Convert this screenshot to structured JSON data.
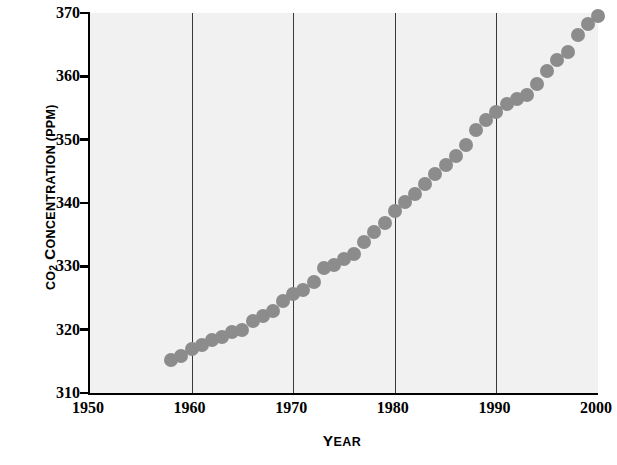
{
  "chart_data": {
    "type": "scatter",
    "title": "",
    "subtitle": "",
    "xlabel": "YEAR",
    "xlabel_cap": "Y",
    "xlabel_rest": "EAR",
    "ylabel": "CO2 CONCENTRATION (PPM)",
    "ylabel_parts": {
      "c": "CO",
      "sub": "2",
      "space": " ",
      "cap1": "C",
      "rest1": "ONCENTRATION",
      "space2": " (",
      "cap2": "PPM",
      "rest2": ")"
    },
    "xlim": [
      1950,
      2000
    ],
    "ylim": [
      310,
      370
    ],
    "xticks": [
      1950,
      1960,
      1970,
      1980,
      1990,
      2000
    ],
    "xticklabels": [
      "1950",
      "1960",
      "1970",
      "1980",
      "1990",
      "2000"
    ],
    "yticks": [
      310,
      320,
      330,
      340,
      350,
      360,
      370
    ],
    "yticklabels": [
      "310",
      "320",
      "330",
      "340",
      "350",
      "360",
      "370"
    ],
    "gridlines_x": [
      1960,
      1970,
      1980,
      1990
    ],
    "grid": "vertical-only",
    "legend": "none",
    "marker": "circle",
    "marker_color": "#8c8c8c",
    "marker_size_px": 14,
    "plot_background": "#f1f1f1",
    "page_background": "#ffffff",
    "axis_color": "#000000",
    "gridline_color": "#3a3a3a",
    "series": [
      {
        "name": "Atmospheric CO2 concentration",
        "x": [
          1958,
          1959,
          1960,
          1961,
          1962,
          1963,
          1964,
          1965,
          1966,
          1967,
          1968,
          1969,
          1970,
          1971,
          1972,
          1973,
          1974,
          1975,
          1976,
          1977,
          1978,
          1979,
          1980,
          1981,
          1982,
          1983,
          1984,
          1985,
          1986,
          1987,
          1988,
          1989,
          1990,
          1991,
          1992,
          1993,
          1994,
          1995,
          1996,
          1997,
          1998,
          1999,
          2000
        ],
        "values": [
          315.2,
          315.9,
          316.9,
          317.6,
          318.4,
          318.9,
          319.6,
          320.0,
          321.4,
          322.2,
          323.0,
          324.6,
          325.7,
          326.3,
          327.5,
          329.7,
          330.2,
          331.1,
          332.0,
          333.8,
          335.4,
          336.8,
          338.7,
          340.1,
          341.4,
          343.0,
          344.6,
          346.0,
          347.4,
          349.2,
          351.6,
          353.1,
          354.4,
          355.6,
          356.4,
          357.1,
          358.8,
          360.8,
          362.6,
          363.8,
          366.6,
          368.3,
          369.5
        ]
      }
    ]
  }
}
